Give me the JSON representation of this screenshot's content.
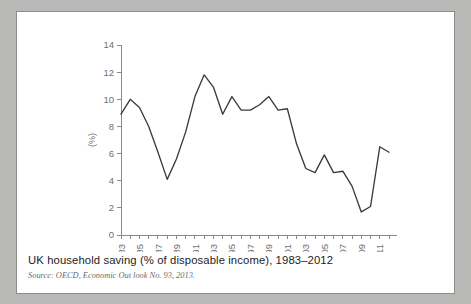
{
  "caption": {
    "title": "UK household saving (% of disposable income), 1983–2012",
    "source": "Source: OECD, Economic Out look No. 93, 2013."
  },
  "colors": {
    "page_background": "#b9b9b7",
    "card_background": "#ffffff",
    "card_border": "#8c8c8a",
    "line": "#3b3b3b",
    "axis": "#8a8a8a",
    "tick_text": "#6f6f6f",
    "title_text": "#1d1d1d",
    "source_text": "#6c6c6c"
  },
  "chart_data": {
    "type": "line",
    "title": "UK household saving (% of disposable income), 1983–2012",
    "xlabel": "",
    "ylabel": "(%)",
    "ylim": [
      0,
      14
    ],
    "ytick_values": [
      0,
      2,
      4,
      6,
      8,
      10,
      12,
      14
    ],
    "ytick_labels": [
      "0",
      "2",
      "4",
      "6",
      "8",
      "10",
      "12",
      "14"
    ],
    "xlim": [
      1983,
      2012
    ],
    "xtick_labels": [
      "1983",
      "1985",
      "1987",
      "1989",
      "1991",
      "1993",
      "1995",
      "1997",
      "1999",
      "2001",
      "2003",
      "2005",
      "2007",
      "2009",
      "2011"
    ],
    "xtick_years": [
      1983,
      1985,
      1987,
      1989,
      1991,
      1993,
      1995,
      1997,
      1999,
      2001,
      2003,
      2005,
      2007,
      2009,
      2011
    ],
    "grid": false,
    "legend": false,
    "x": [
      1983,
      1984,
      1985,
      1986,
      1987,
      1988,
      1989,
      1990,
      1991,
      1992,
      1993,
      1994,
      1995,
      1996,
      1997,
      1998,
      1999,
      2000,
      2001,
      2002,
      2003,
      2004,
      2005,
      2006,
      2007,
      2008,
      2009,
      2010,
      2011,
      2012
    ],
    "series": [
      {
        "name": "UK household saving",
        "values": [
          8.9,
          10.0,
          9.4,
          8.0,
          6.1,
          4.1,
          5.6,
          7.6,
          10.2,
          11.8,
          10.9,
          8.9,
          10.2,
          9.2,
          9.2,
          9.6,
          10.2,
          9.2,
          9.3,
          6.7,
          4.9,
          4.6,
          5.9,
          4.6,
          4.7,
          3.6,
          1.7,
          2.1,
          6.5,
          6.1
        ]
      }
    ]
  }
}
